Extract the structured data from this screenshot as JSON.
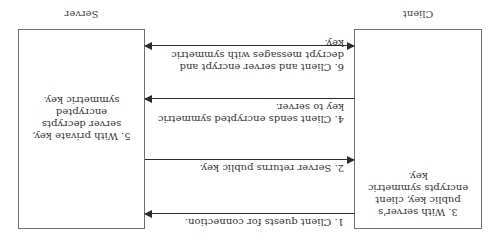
{
  "diagram": {
    "title_fragment": "",
    "actors": {
      "client": {
        "label": "Client"
      },
      "server": {
        "label": "Server"
      }
    },
    "box_notes": {
      "client": "3. With server's public key, client encrypts symmetric key.",
      "server": "5. With private key, server decrypts encrypted symmetric key."
    },
    "messages": [
      {
        "step": 1,
        "text": "1. Client quests for connection.",
        "from": "client",
        "to": "server",
        "direction": "right"
      },
      {
        "step": 2,
        "text": "2. Server returns public key.",
        "from": "server",
        "to": "client",
        "direction": "left"
      },
      {
        "step": 4,
        "text": "4. Client sends encrypted symmetric key to server.",
        "from": "client",
        "to": "server",
        "direction": "right"
      },
      {
        "step": 6,
        "text": "6. Client and server encrypt and decrypt messages with symmetric key.",
        "from": "client",
        "to": "server",
        "direction": "both"
      }
    ],
    "orientation": "rotated-180",
    "colors": {
      "line": "#2b2b2b",
      "box_border": "#6e6e6e",
      "text": "#333333",
      "background": "#ffffff"
    }
  }
}
